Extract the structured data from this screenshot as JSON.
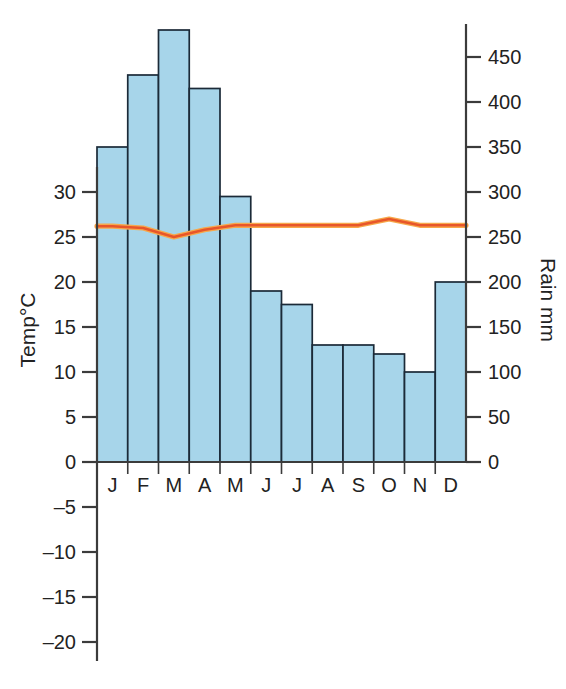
{
  "chart_data": {
    "type": "bar",
    "title": "",
    "subtitle": "",
    "categories": [
      "J",
      "F",
      "M",
      "A",
      "M",
      "J",
      "J",
      "A",
      "S",
      "O",
      "N",
      "D"
    ],
    "month_names": [
      "January",
      "February",
      "March",
      "April",
      "May",
      "June",
      "July",
      "August",
      "September",
      "October",
      "November",
      "December"
    ],
    "series": [
      {
        "name": "Rain mm",
        "type": "bar",
        "axis": "right",
        "color": "#a7d5ea",
        "values": [
          350,
          430,
          480,
          415,
          295,
          190,
          175,
          130,
          130,
          120,
          100,
          200
        ]
      },
      {
        "name": "Temp°C",
        "type": "line",
        "axis": "left",
        "color": "#e8562a",
        "values": [
          26.2,
          26.0,
          25.0,
          25.8,
          26.3,
          26.3,
          26.3,
          26.3,
          26.3,
          27.0,
          26.3,
          26.3
        ]
      }
    ],
    "left_axis": {
      "label": "Temp°C",
      "ticks": [
        30,
        25,
        20,
        15,
        10,
        5,
        0,
        -5,
        -10,
        -15,
        -20
      ],
      "tick_labels": [
        "30",
        "25",
        "20",
        "15",
        "10",
        "5",
        "0",
        "–5",
        "–10",
        "–15",
        "–20"
      ],
      "min": -20,
      "max": 35
    },
    "right_axis": {
      "label": "Rain mm",
      "ticks": [
        450,
        400,
        350,
        300,
        250,
        200,
        150,
        100,
        50,
        0
      ],
      "tick_labels": [
        "450",
        "400",
        "350",
        "300",
        "250",
        "200",
        "150",
        "100",
        "50",
        "0"
      ],
      "min": 0,
      "max": 450
    },
    "xlabel": "",
    "grid": false,
    "legend": "none"
  },
  "colors": {
    "bar_fill": "#a7d5ea",
    "bar_stroke": "#1b2a38",
    "line": "#e8562a",
    "line_halo": "#f7a84b",
    "axis": "#3b3b3b",
    "text": "#222222",
    "background": "#ffffff"
  }
}
